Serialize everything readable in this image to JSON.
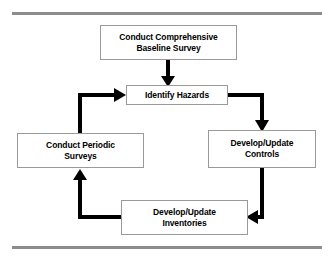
{
  "diagram": {
    "type": "cyclic-flowchart",
    "colors": {
      "background": "#ffffff",
      "node_fill": "#ffffff",
      "node_border": "#9a9a9a",
      "connector": "#000000",
      "rule": "#8c8c8c",
      "text": "#000000"
    },
    "rules": {
      "top_label": "top-divider-rule",
      "bottom_label": "bottom-divider-rule"
    },
    "nodes": [
      {
        "id": "baseline-survey",
        "label": "Conduct Comprehensive\nBaseline Survey",
        "role": "entry-point"
      },
      {
        "id": "identify-hazards",
        "label": "Identify Hazards",
        "role": "cycle-hub"
      },
      {
        "id": "controls",
        "label": "Develop/Update\nControls",
        "role": "cycle-step"
      },
      {
        "id": "inventories",
        "label": "Develop/Update\nInventories",
        "role": "cycle-step"
      },
      {
        "id": "periodic-surveys",
        "label": "Conduct Periodic\nSurveys",
        "role": "cycle-step"
      }
    ],
    "edges": [
      {
        "id": "edge-baseline-to-hazards",
        "from": "baseline-survey",
        "to": "identify-hazards",
        "shape": "straight-down"
      },
      {
        "id": "edge-hazards-to-controls",
        "from": "identify-hazards",
        "to": "controls",
        "shape": "right-then-down"
      },
      {
        "id": "edge-controls-to-inventories",
        "from": "controls",
        "to": "inventories",
        "shape": "down-then-left"
      },
      {
        "id": "edge-inventories-to-surveys",
        "from": "inventories",
        "to": "periodic-surveys",
        "shape": "left-then-up"
      },
      {
        "id": "edge-surveys-to-hazards",
        "from": "periodic-surveys",
        "to": "identify-hazards",
        "shape": "up-then-right"
      }
    ]
  }
}
